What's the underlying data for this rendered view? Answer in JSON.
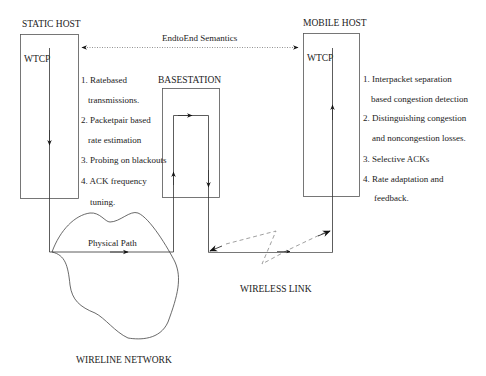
{
  "diagram": {
    "static_host": {
      "label": "STATIC HOST",
      "protocol": "WTCP",
      "features": [
        {
          "line1": "1. Ratebased",
          "line2": "transmissions."
        },
        {
          "line1": "2. Packetpair based",
          "line2": "rate estimation"
        },
        {
          "line1": "3. Probing on blackouts",
          "line2": ""
        },
        {
          "line1": "4. ACK frequency",
          "line2": "tuning."
        }
      ]
    },
    "base_station": {
      "label": "BASESTATION"
    },
    "mobile_host": {
      "label": "MOBILE HOST",
      "protocol": "WTCP",
      "features": [
        {
          "line1": "1. Interpacket separation",
          "line2": "based congestion detection"
        },
        {
          "line1": "2. Distinguishing congestion",
          "line2": "and noncongestion losses."
        },
        {
          "line1": "3. Selective ACKs",
          "line2": ""
        },
        {
          "line1": "4. Rate adaptation and",
          "line2": "feedback."
        }
      ]
    },
    "end_to_end": {
      "label": "EndtoEnd Semantics",
      "style": "dotted",
      "direction": "bidirectional"
    },
    "physical_path": {
      "label": "Physical Path"
    },
    "wireline_network": {
      "label": "WIRELINE NETWORK"
    },
    "wireless_link": {
      "label": "WIRELESS LINK",
      "style": "dashed lightning"
    },
    "colors": {
      "line": "#333333",
      "dashed": "#888888",
      "text": "#222222"
    }
  }
}
